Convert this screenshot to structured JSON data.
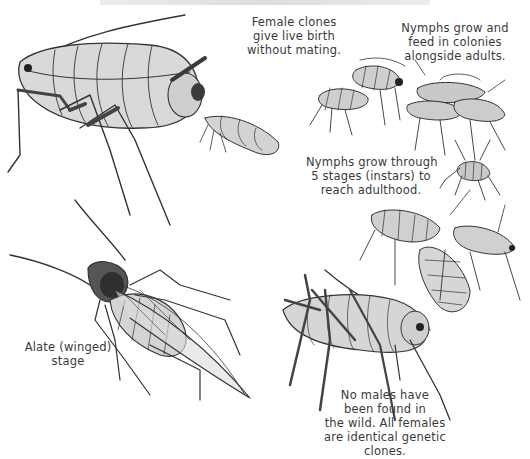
{
  "figure": {
    "colors": {
      "background": "#ffffff",
      "outline": "#333333",
      "body_fill": "#d6d6d6",
      "body_shade": "#bdbdbd",
      "dark_parts": "#3a3a3a",
      "text": "#3a3a3a"
    },
    "labels": {
      "female_clones": [
        "Female clones",
        "give live birth",
        "without mating."
      ],
      "nymphs_colonies": [
        "Nymphs grow and",
        "feed in colonies",
        "alongside adults."
      ],
      "nymphs_instars": [
        "Nymphs grow through",
        "5 stages (instars) to",
        "reach adulthood."
      ],
      "alate": [
        "Alate (winged)",
        "stage"
      ],
      "no_males": [
        "No males have",
        "been found in",
        "the wild. All females",
        "are identical genetic",
        "clones."
      ]
    },
    "illustrations": [
      {
        "id": "adult-female-giving-birth",
        "description": "large wingless adult female aphid birthing a nymph"
      },
      {
        "id": "nymph-colony",
        "description": "group of nymphs feeding with adults"
      },
      {
        "id": "small-nymph",
        "description": "small early-instar nymph"
      },
      {
        "id": "alate-winged-aphid",
        "description": "winged adult aphid viewed from above"
      },
      {
        "id": "nymph-cluster-lower-right",
        "description": "cluster of three larger nymphs"
      },
      {
        "id": "adult-side-view",
        "description": "wingless adult aphid side view with long legs"
      }
    ]
  }
}
